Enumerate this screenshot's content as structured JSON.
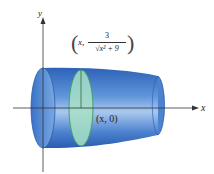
{
  "diagram": {
    "axes": {
      "x_label": "x",
      "y_label": "y"
    },
    "point_label": "(x, 0)",
    "curve_point": {
      "prefix": "x,",
      "numerator": "3",
      "denominator": "√x² + 9"
    },
    "colors": {
      "solid": "#3d78c9",
      "solid_light": "#9cc0ea",
      "disk": "#a8e0c6",
      "disk_edge": "#3fa26b",
      "axis": "#333333"
    }
  }
}
